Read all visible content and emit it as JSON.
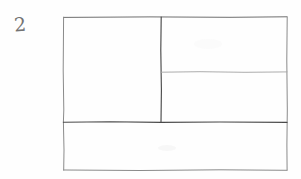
{
  "figure": {
    "label": "2",
    "kind": "hand-drawn-layout-wireframe",
    "medium": "pencil on paper",
    "background_color": "#fefefe"
  },
  "canvas": {
    "width": 301,
    "height": 179
  },
  "colors": {
    "ink_dark": "#3d3d3d",
    "ink_mid": "#6e6e6e",
    "ink_light": "#a8a8a8",
    "label_ink": "#737373",
    "paper": "#fefefe"
  },
  "outer_frame": {
    "name": "page-outline",
    "x": 63,
    "y": 17,
    "width": 224,
    "height": 153,
    "stroke": "#6e6e6e",
    "stroke_width": 1
  },
  "regions": [
    {
      "id": "left-panel",
      "name": "region-left-large",
      "x": 63,
      "y": 17,
      "width": 98,
      "height": 105,
      "label": ""
    },
    {
      "id": "right-top-panel",
      "name": "region-right-top",
      "x": 161,
      "y": 17,
      "width": 126,
      "height": 55,
      "label": ""
    },
    {
      "id": "right-bottom-panel",
      "name": "region-right-bottom",
      "x": 161,
      "y": 72,
      "width": 126,
      "height": 50,
      "label": ""
    },
    {
      "id": "bottom-band",
      "name": "region-bottom-full-width",
      "x": 63,
      "y": 122,
      "width": 224,
      "height": 48,
      "label": ""
    }
  ],
  "divider_lines": [
    {
      "id": "vertical-divider",
      "name": "divider-vertical-left-right",
      "x1": 161,
      "y1": 17,
      "x2": 161,
      "y2": 122,
      "stroke": "#4a4a4a",
      "stroke_width": 1.1
    },
    {
      "id": "right-horizontal-divider",
      "name": "divider-horizontal-right-upper",
      "x1": 161,
      "y1": 72,
      "x2": 287,
      "y2": 72,
      "stroke": "#a8a8a8",
      "stroke_width": 0.9
    },
    {
      "id": "bottom-band-divider",
      "name": "divider-horizontal-bottom-band",
      "x1": 63,
      "y1": 122,
      "x2": 287,
      "y2": 122,
      "stroke": "#4a4a4a",
      "stroke_width": 1.1
    }
  ]
}
